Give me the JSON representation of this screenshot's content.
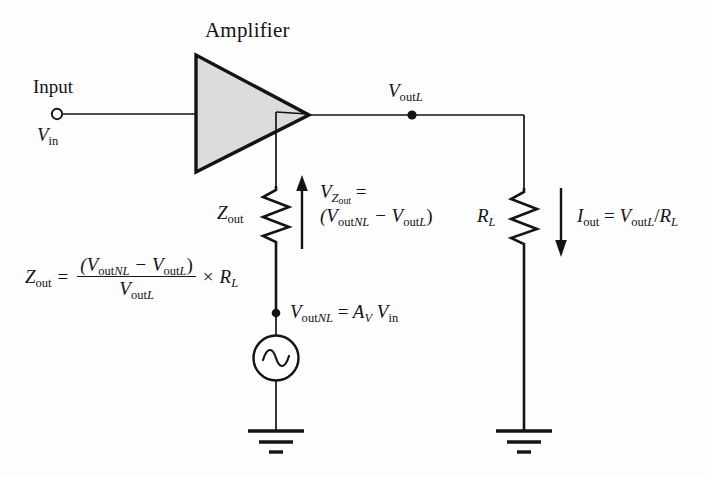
{
  "figure": {
    "type": "circuit-diagram",
    "background_color": "#fdfdfd",
    "line_color": "#141414",
    "amplifier_fill": "#dcdcdc"
  },
  "labels": {
    "amplifier": "Amplifier",
    "input": "Input",
    "v_in": "V",
    "v_in_sub": "in",
    "v_out_l": "V",
    "v_out_l_sub_up": "out",
    "v_out_l_sub_it": "L",
    "z_out": "Z",
    "z_out_sub": "out",
    "r_l": "R",
    "r_l_sub": "L",
    "i_out": "I",
    "i_out_sub": "out"
  },
  "equations": {
    "v_z_out": {
      "line1_var": "V",
      "line1_sub_var": "Z",
      "line1_sub_sub": "out",
      "line1_eq": "=",
      "line2": "(V",
      "line2_sub1_up": "out",
      "line2_sub1_it": "NL",
      "line2_minus": "− V",
      "line2_sub2_up": "out",
      "line2_sub2_it": "L",
      "line2_close": ")"
    },
    "i_out": {
      "lhs": "I",
      "lhs_sub": "out",
      "eq": "=",
      "num_var": "V",
      "num_sub_up": "out",
      "num_sub_it": "L",
      "slash": "/",
      "den_var": "R",
      "den_sub": "L"
    },
    "v_out_nl": {
      "lhs": "V",
      "lhs_sub_up": "out",
      "lhs_sub_it": "NL",
      "eq": "=",
      "rhs1": "A",
      "rhs1_sub": "V",
      "rhs2": "V",
      "rhs2_sub": "in"
    },
    "z_out_formula": {
      "lhs": "Z",
      "lhs_sub": "out",
      "eq": "=",
      "numerator_open": "(V",
      "numerator_sub1_up": "out",
      "numerator_sub1_it": "NL",
      "numerator_minus": "− V",
      "numerator_sub2_up": "out",
      "numerator_sub2_it": "L",
      "numerator_close": ")",
      "denominator": "V",
      "denominator_sub_up": "out",
      "denominator_sub_it": "L",
      "times": "×",
      "rhs": "R",
      "rhs_sub": "L"
    }
  },
  "components": {
    "input_terminal": "open-circle-terminal",
    "amplifier_symbol": "triangle-amplifier",
    "z_out_resistor": "zigzag-resistor",
    "r_l_resistor": "zigzag-resistor",
    "ac_source": "sine-source",
    "ground_left": "earth-ground",
    "ground_right": "earth-ground",
    "node_v_out_l": "junction-dot",
    "node_v_out_nl": "junction-dot",
    "arrow_v_z_out": "up-arrow",
    "arrow_i_out": "down-arrow"
  }
}
